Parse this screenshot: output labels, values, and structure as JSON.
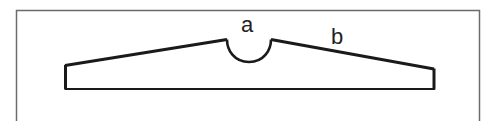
{
  "diagram": {
    "type": "cross-section profile",
    "labels": {
      "notch": "a",
      "slope": "b"
    },
    "colors": {
      "background": "#ffffff",
      "frame": "#6b6b6b",
      "outline": "#1a1a1a",
      "text": "#222222"
    },
    "frame": {
      "left": 16,
      "top": 10,
      "right": 479,
      "bottom": 121,
      "open_bottom": true
    },
    "profile": {
      "left_wall": {
        "x": 65,
        "top": 65,
        "bottom": 89
      },
      "right_wall": {
        "x": 434,
        "top": 69,
        "bottom": 89
      },
      "base_y": 89,
      "notch": {
        "start_x": 227,
        "end_x": 271,
        "top_y": 39,
        "depth_y": 62
      }
    }
  }
}
